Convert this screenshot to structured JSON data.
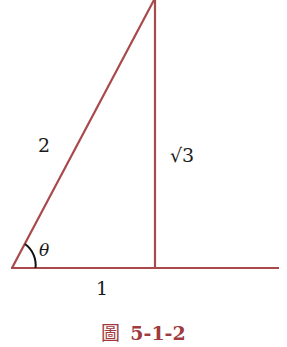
{
  "figure": {
    "caption_prefix": "圖",
    "caption_number": "5-1-2",
    "line_color": "#a8494b",
    "caption_color": "#a03a3e"
  },
  "triangle": {
    "hypotenuse_label": "2",
    "opposite_label": "√3",
    "adjacent_label": "1",
    "angle_label": "θ",
    "vertices": {
      "angle_vertex": [
        12,
        268
      ],
      "right_angle_vertex": [
        155,
        268
      ],
      "top_vertex": [
        154,
        0
      ]
    },
    "baseline_extends_to": [
      279,
      268
    ]
  }
}
